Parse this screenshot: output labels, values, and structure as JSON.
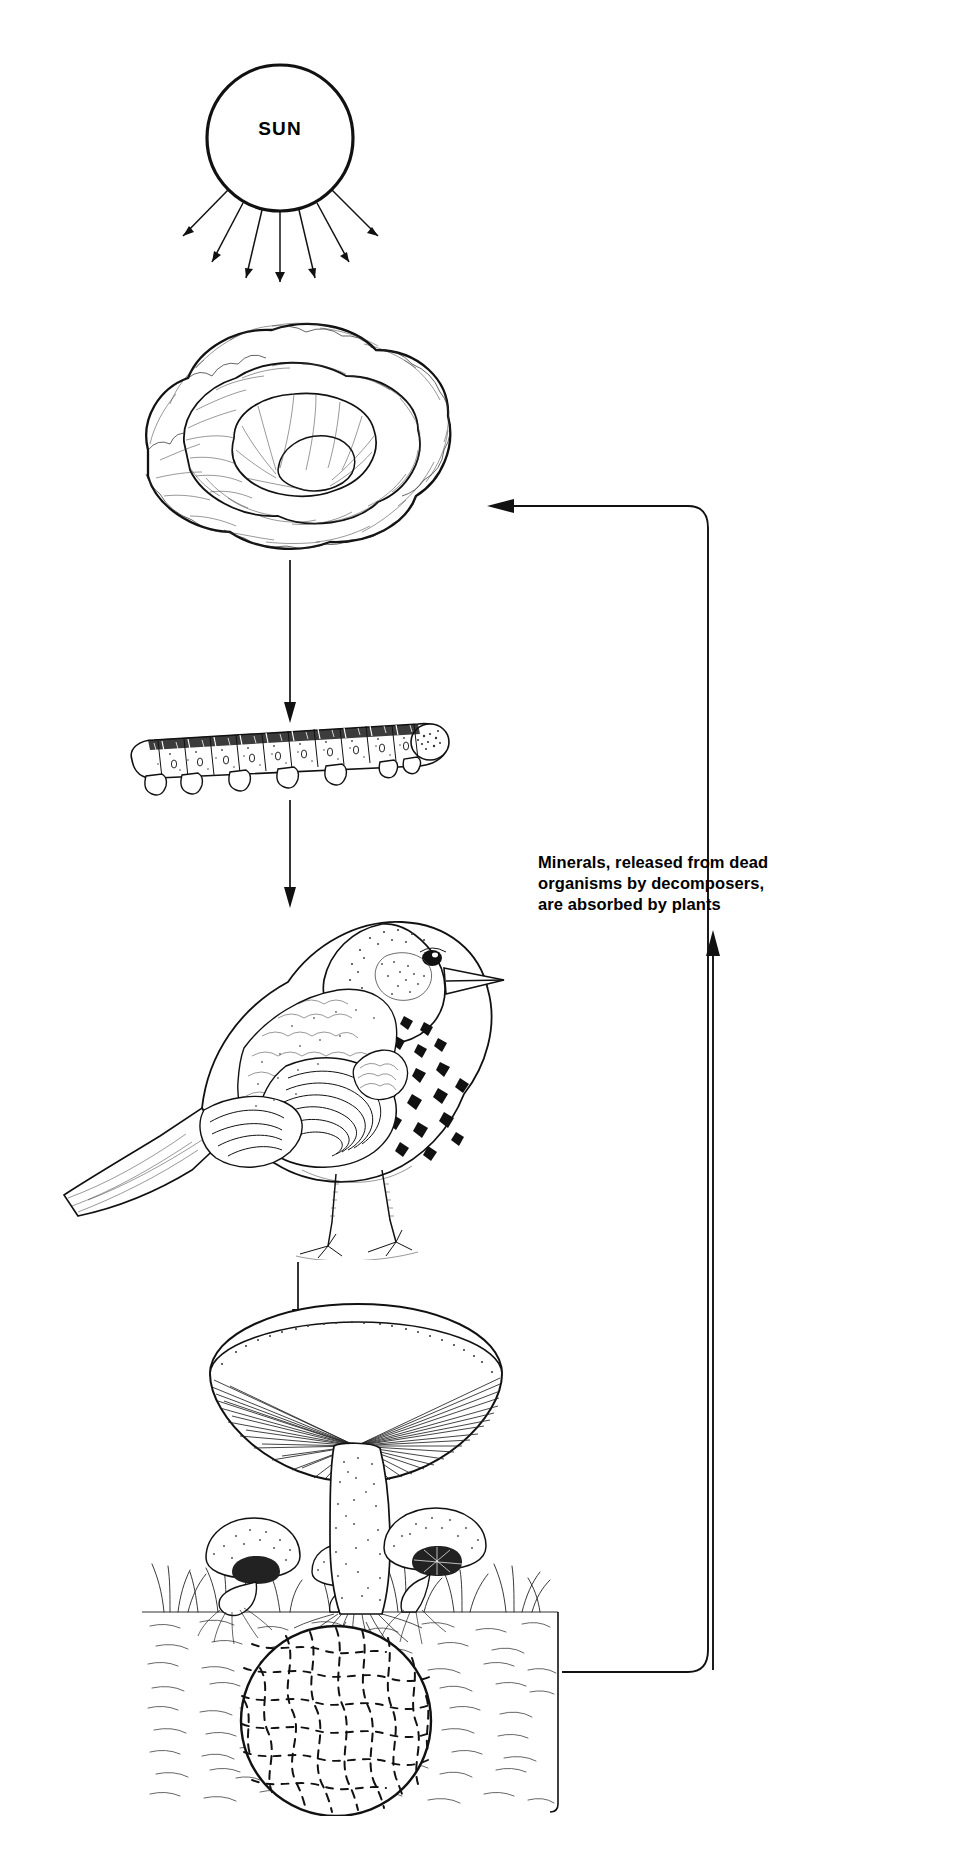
{
  "diagram": {
    "background_color": "#ffffff",
    "ink_color": "#111111",
    "width": 968,
    "height": 1864
  },
  "nodes": [
    {
      "id": "sun",
      "label": "SUN",
      "icon": "sun-circle-icon",
      "role": "energy source",
      "shape": "circle"
    },
    {
      "id": "cabbage",
      "label": "",
      "icon": "cabbage-icon",
      "role": "producer"
    },
    {
      "id": "caterpillar",
      "label": "",
      "icon": "caterpillar-icon",
      "role": "primary consumer"
    },
    {
      "id": "bird",
      "label": "",
      "icon": "thrush-bird-icon",
      "role": "secondary consumer"
    },
    {
      "id": "mushrooms",
      "label": "",
      "icon": "mushrooms-icon",
      "role": "decomposer"
    },
    {
      "id": "soil",
      "label": "",
      "icon": "soil-block-icon",
      "role": "substrate"
    },
    {
      "id": "hyphae",
      "label": "",
      "icon": "magnified-hyphae-circle-icon",
      "role": "fungal mycelium detail"
    }
  ],
  "caption": {
    "lines": [
      "Minerals, released from dead",
      "organisms by decomposers,",
      "are absorbed by plants"
    ],
    "text": "Minerals, released from dead organisms by decomposers, are absorbed by plants"
  },
  "sun_rays": {
    "count": 7,
    "description": "seven arrows radiating downward from the sun"
  },
  "flow_arrows": [
    {
      "from": "cabbage",
      "to": "caterpillar",
      "direction": "down"
    },
    {
      "from": "caterpillar",
      "to": "bird",
      "direction": "down"
    },
    {
      "from": "bird",
      "to": "mushrooms",
      "direction": "down"
    },
    {
      "from": "soil",
      "to": "cabbage",
      "direction": "return loop, up and left"
    },
    {
      "from": "soil",
      "to": "caption",
      "direction": "up"
    }
  ]
}
